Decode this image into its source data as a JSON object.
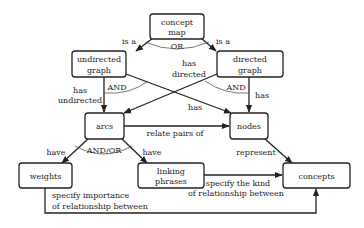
{
  "diagram": {
    "type": "concept-map",
    "nodes": [
      {
        "id": "concept_map",
        "lines": [
          "concept",
          "map"
        ]
      },
      {
        "id": "undirected_graph",
        "lines": [
          "undirected",
          "graph"
        ]
      },
      {
        "id": "directed_graph",
        "lines": [
          "directed",
          "graph"
        ]
      },
      {
        "id": "arcs",
        "lines": [
          "arcs"
        ]
      },
      {
        "id": "nodes",
        "lines": [
          "nodes"
        ]
      },
      {
        "id": "weights",
        "lines": [
          "weights"
        ]
      },
      {
        "id": "linking_phrases",
        "lines": [
          "linking",
          "phrases"
        ]
      },
      {
        "id": "concepts",
        "lines": [
          "concepts"
        ]
      }
    ],
    "edges": [
      {
        "from": "concept_map",
        "to": "undirected_graph",
        "label": "is a"
      },
      {
        "from": "concept_map",
        "to": "directed_graph",
        "label": "is a"
      },
      {
        "from": "undirected_graph",
        "to": "arcs",
        "label": [
          "has",
          "undirected"
        ]
      },
      {
        "from": "undirected_graph",
        "to": "nodes",
        "label": "has"
      },
      {
        "from": "directed_graph",
        "to": "arcs",
        "label": [
          "has",
          "directed"
        ]
      },
      {
        "from": "directed_graph",
        "to": "nodes",
        "label": "has"
      },
      {
        "from": "arcs",
        "to": "nodes",
        "label": "relate pairs of"
      },
      {
        "from": "arcs",
        "to": "weights",
        "label": "have"
      },
      {
        "from": "arcs",
        "to": "linking_phrases",
        "label": "have"
      },
      {
        "from": "nodes",
        "to": "concepts",
        "label": "represent"
      },
      {
        "from": "linking_phrases",
        "to": "concepts",
        "label": [
          "specify the kind",
          "of relationship between"
        ]
      },
      {
        "from": "weights",
        "to": "concepts",
        "label": [
          "specify importance",
          "of relationship between"
        ]
      }
    ],
    "operators": [
      {
        "at": "concept_map",
        "label": "OR"
      },
      {
        "at": "undirected_graph",
        "label": "AND"
      },
      {
        "at": "directed_graph",
        "label": "AND"
      },
      {
        "at": "arcs",
        "label": "AND/OR"
      }
    ]
  },
  "labels": {
    "concept_map_1": "concept",
    "concept_map_2": "map",
    "undirected_1": "undirected",
    "undirected_2": "graph",
    "directed_1": "directed",
    "directed_2": "graph",
    "arcs": "arcs",
    "nodes": "nodes",
    "weights": "weights",
    "linking_1": "linking",
    "linking_2": "phrases",
    "concepts": "concepts",
    "is_a_left": "is a",
    "is_a_right": "is a",
    "or": "OR",
    "and_left": "AND",
    "and_right": "AND",
    "has_undirected_1": "has",
    "has_undirected_2": "undirected",
    "has_directed_1": "has",
    "has_directed_2": "directed",
    "has_cross": "has",
    "has_right": "has",
    "relate_pairs_of": "relate pairs of",
    "and_or": "AND/OR",
    "have_left": "have",
    "have_right": "have",
    "represent": "represent",
    "specify_kind_1": "specify the kind",
    "specify_kind_2": "of relationship between",
    "specify_importance_1": "specify importance",
    "specify_importance_2": "of relationship between"
  }
}
